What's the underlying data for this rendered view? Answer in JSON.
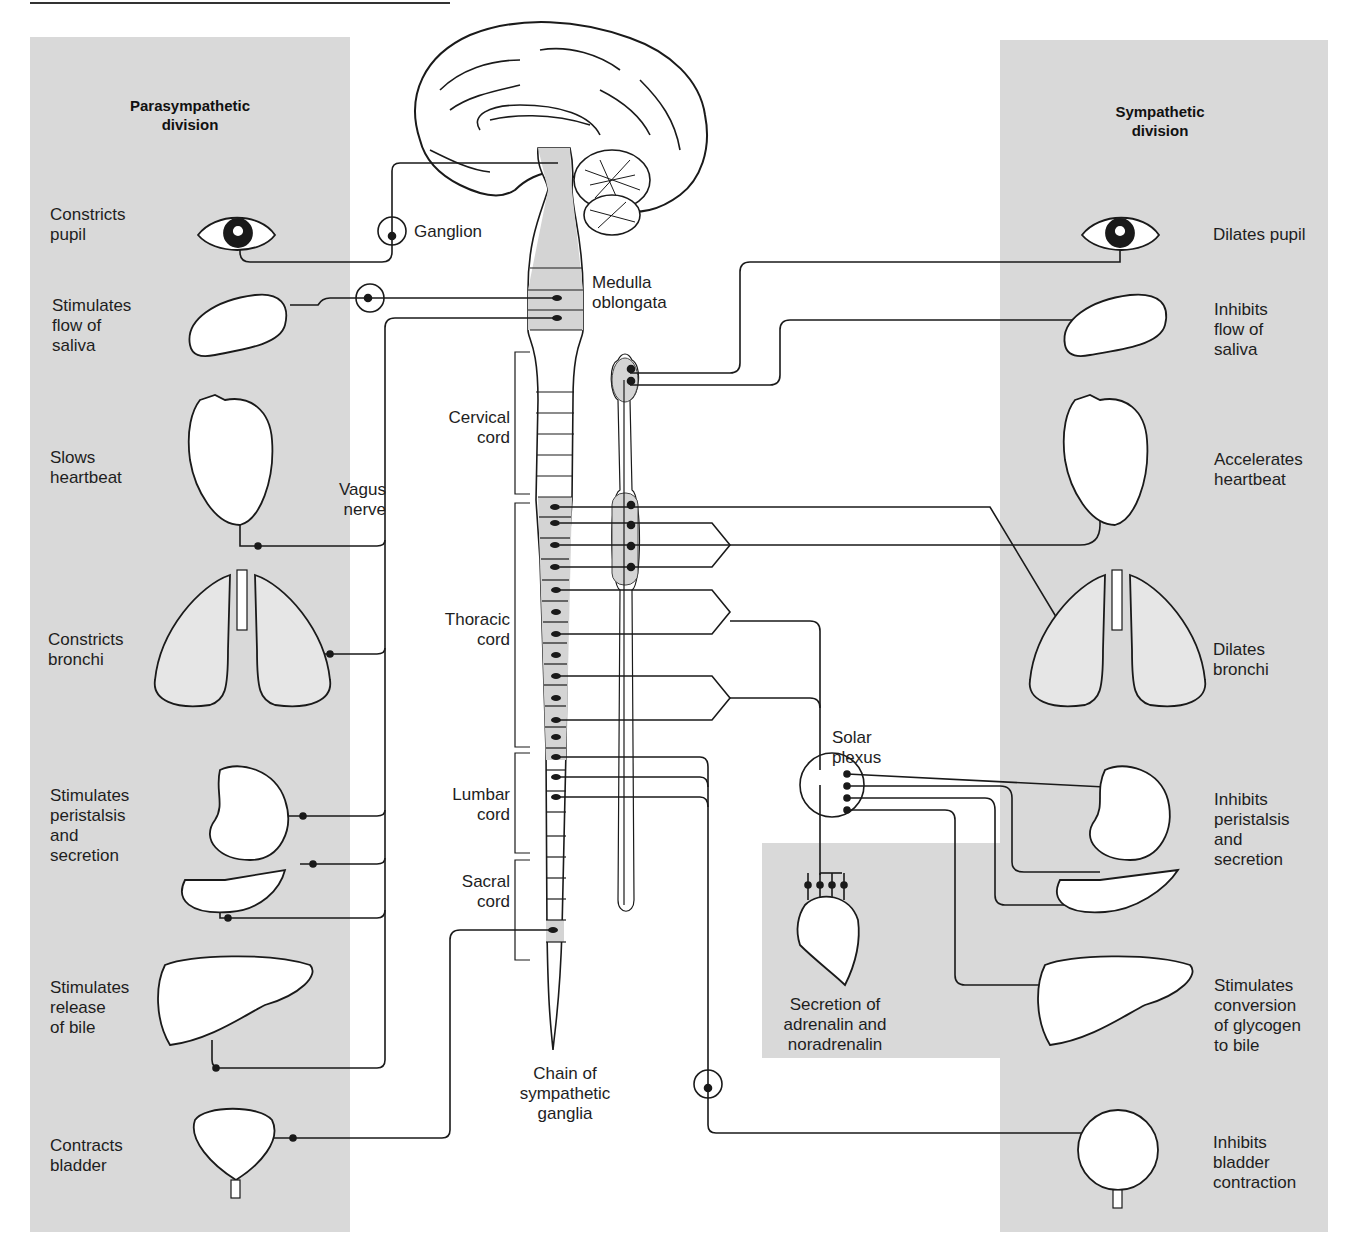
{
  "colors": {
    "panel": "#d9d9d9",
    "shaded_segment": "#d4d4d4",
    "line": "#1a1a1a",
    "background": "#ffffff"
  },
  "divisions": {
    "parasympathetic": {
      "title_line1": "Parasympathetic",
      "title_line2": "division"
    },
    "sympathetic": {
      "title_line1": "Sympathetic",
      "title_line2": "division"
    }
  },
  "parasympathetic_effects": [
    {
      "organ": "eye",
      "line1": "Constricts",
      "line2": "pupil",
      "line3": "",
      "line4": ""
    },
    {
      "organ": "salivary-gland",
      "line1": "Stimulates",
      "line2": "flow of",
      "line3": "saliva",
      "line4": ""
    },
    {
      "organ": "heart",
      "line1": "Slows",
      "line2": "heartbeat",
      "line3": "",
      "line4": ""
    },
    {
      "organ": "lungs",
      "line1": "Constricts",
      "line2": "bronchi",
      "line3": "",
      "line4": ""
    },
    {
      "organ": "stomach-pancreas",
      "line1": "Stimulates",
      "line2": "peristalsis",
      "line3": "and",
      "line4": "secretion"
    },
    {
      "organ": "liver",
      "line1": "Stimulates",
      "line2": "release",
      "line3": "of bile",
      "line4": ""
    },
    {
      "organ": "bladder",
      "line1": "Contracts",
      "line2": "bladder",
      "line3": "",
      "line4": ""
    }
  ],
  "sympathetic_effects": [
    {
      "organ": "eye",
      "line1": "Dilates pupil",
      "line2": "",
      "line3": "",
      "line4": ""
    },
    {
      "organ": "salivary-gland",
      "line1": "Inhibits",
      "line2": "flow of",
      "line3": "saliva",
      "line4": ""
    },
    {
      "organ": "heart",
      "line1": "Accelerates",
      "line2": "heartbeat",
      "line3": "",
      "line4": ""
    },
    {
      "organ": "lungs",
      "line1": "Dilates",
      "line2": "bronchi",
      "line3": "",
      "line4": ""
    },
    {
      "organ": "stomach-pancreas",
      "line1": "Inhibits",
      "line2": "peristalsis",
      "line3": "and",
      "line4": "secretion"
    },
    {
      "organ": "liver",
      "line1": "Stimulates",
      "line2": "conversion",
      "line3": "of glycogen",
      "line4": "to bile"
    },
    {
      "organ": "bladder",
      "line1": "Inhibits",
      "line2": "bladder",
      "line3": "contraction",
      "line4": ""
    }
  ],
  "central_labels": {
    "ganglion": "Ganglion",
    "medulla_line1": "Medulla",
    "medulla_line2": "oblongata",
    "vagus_line1": "Vagus",
    "vagus_line2": "nerve",
    "cervical_line1": "Cervical",
    "cervical_line2": "cord",
    "thoracic_line1": "Thoracic",
    "thoracic_line2": "cord",
    "lumbar_line1": "Lumbar",
    "lumbar_line2": "cord",
    "sacral_line1": "Sacral",
    "sacral_line2": "cord",
    "chain_line1": "Chain of",
    "chain_line2": "sympathetic",
    "chain_line3": "ganglia",
    "solar_line1": "Solar",
    "solar_line2": "plexus",
    "adrenal_line1": "Secretion of",
    "adrenal_line2": "adrenalin and",
    "adrenal_line3": "noradrenalin"
  }
}
